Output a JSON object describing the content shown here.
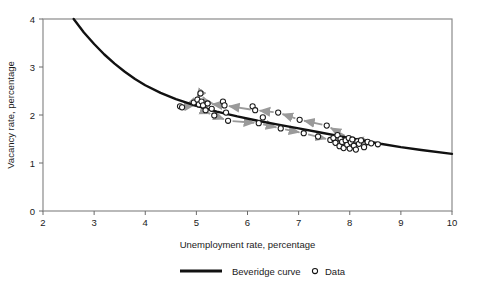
{
  "chart_data": {
    "type": "scatter",
    "title": "",
    "xlabel": "Unemployment rate, percentage",
    "ylabel": "Vacancy rate, percentage",
    "xlim": [
      2,
      10
    ],
    "ylim": [
      0,
      4
    ],
    "xticks": [
      2,
      3,
      4,
      5,
      6,
      7,
      8,
      9,
      10
    ],
    "yticks": [
      0,
      1,
      2,
      3,
      4
    ],
    "grid": false,
    "legend_position": "bottom-center",
    "legend": [
      {
        "label": "Beveridge curve",
        "marker": "line",
        "color": "#111111"
      },
      {
        "label": "Data",
        "marker": "circle-open",
        "color": "#111111"
      }
    ],
    "series": [
      {
        "name": "Beveridge curve",
        "type": "line",
        "color": "#111111",
        "linewidth": 2.4,
        "points": [
          [
            2.6,
            4.0
          ],
          [
            2.8,
            3.72
          ],
          [
            3.0,
            3.48
          ],
          [
            3.2,
            3.26
          ],
          [
            3.4,
            3.07
          ],
          [
            3.6,
            2.9
          ],
          [
            3.8,
            2.75
          ],
          [
            4.0,
            2.62
          ],
          [
            4.3,
            2.46
          ],
          [
            4.6,
            2.33
          ],
          [
            5.0,
            2.19
          ],
          [
            5.4,
            2.07
          ],
          [
            5.8,
            1.97
          ],
          [
            6.2,
            1.88
          ],
          [
            6.6,
            1.8
          ],
          [
            7.0,
            1.72
          ],
          [
            7.4,
            1.64
          ],
          [
            7.8,
            1.56
          ],
          [
            8.2,
            1.48
          ],
          [
            8.6,
            1.4
          ],
          [
            9.0,
            1.33
          ],
          [
            9.4,
            1.27
          ],
          [
            10.0,
            1.19
          ]
        ]
      },
      {
        "name": "Data",
        "type": "scatter",
        "marker": "circle-open",
        "color": "#1a1a1a",
        "points": [
          [
            4.68,
            2.18
          ],
          [
            4.72,
            2.16
          ],
          [
            4.95,
            2.26
          ],
          [
            5.02,
            2.32
          ],
          [
            5.05,
            2.22
          ],
          [
            5.08,
            2.45
          ],
          [
            5.1,
            2.28
          ],
          [
            5.13,
            2.2
          ],
          [
            5.18,
            2.1
          ],
          [
            5.22,
            2.24
          ],
          [
            5.3,
            2.13
          ],
          [
            5.35,
            1.99
          ],
          [
            5.52,
            2.28
          ],
          [
            5.55,
            2.2
          ],
          [
            5.58,
            2.05
          ],
          [
            5.62,
            1.88
          ],
          [
            6.1,
            2.18
          ],
          [
            6.15,
            2.1
          ],
          [
            6.22,
            1.83
          ],
          [
            6.3,
            1.95
          ],
          [
            6.6,
            2.05
          ],
          [
            6.65,
            1.72
          ],
          [
            7.02,
            1.9
          ],
          [
            7.1,
            1.62
          ],
          [
            7.38,
            1.55
          ],
          [
            7.55,
            1.78
          ],
          [
            7.62,
            1.48
          ],
          [
            7.68,
            1.52
          ],
          [
            7.72,
            1.42
          ],
          [
            7.76,
            1.58
          ],
          [
            7.8,
            1.35
          ],
          [
            7.82,
            1.5
          ],
          [
            7.85,
            1.44
          ],
          [
            7.88,
            1.31
          ],
          [
            7.92,
            1.47
          ],
          [
            7.95,
            1.38
          ],
          [
            7.98,
            1.52
          ],
          [
            8.0,
            1.3
          ],
          [
            8.02,
            1.43
          ],
          [
            8.05,
            1.49
          ],
          [
            8.08,
            1.36
          ],
          [
            8.12,
            1.28
          ],
          [
            8.15,
            1.45
          ],
          [
            8.18,
            1.4
          ],
          [
            8.22,
            1.47
          ],
          [
            8.28,
            1.33
          ],
          [
            8.35,
            1.44
          ],
          [
            8.42,
            1.41
          ],
          [
            8.55,
            1.39
          ]
        ]
      }
    ],
    "arrows": {
      "color": "#9a9a9a",
      "description": "grey connector arrows tracing the loop path over time",
      "upper_branch_direction": "leftward",
      "lower_branch_direction": "rightward",
      "segments": [
        [
          8.55,
          1.39,
          7.98,
          1.52
        ],
        [
          7.98,
          1.52,
          7.55,
          1.78
        ],
        [
          7.55,
          1.78,
          7.02,
          1.9
        ],
        [
          7.02,
          1.9,
          6.6,
          2.05
        ],
        [
          6.6,
          2.05,
          6.15,
          2.1
        ],
        [
          6.15,
          2.1,
          5.55,
          2.2
        ],
        [
          5.55,
          2.2,
          5.22,
          2.24
        ],
        [
          5.22,
          2.24,
          5.08,
          2.45
        ],
        [
          5.08,
          2.45,
          4.95,
          2.26
        ],
        [
          4.95,
          2.26,
          4.7,
          2.17
        ],
        [
          4.7,
          2.17,
          5.05,
          2.22
        ],
        [
          5.1,
          2.1,
          5.35,
          1.99
        ],
        [
          5.35,
          1.99,
          5.62,
          1.88
        ],
        [
          5.62,
          1.88,
          6.22,
          1.83
        ],
        [
          6.22,
          1.83,
          6.65,
          1.72
        ],
        [
          6.65,
          1.72,
          7.1,
          1.62
        ],
        [
          7.1,
          1.62,
          7.62,
          1.48
        ],
        [
          7.62,
          1.48,
          8.0,
          1.36
        ],
        [
          8.0,
          1.36,
          8.3,
          1.42
        ],
        [
          8.3,
          1.42,
          8.55,
          1.39
        ]
      ]
    }
  }
}
